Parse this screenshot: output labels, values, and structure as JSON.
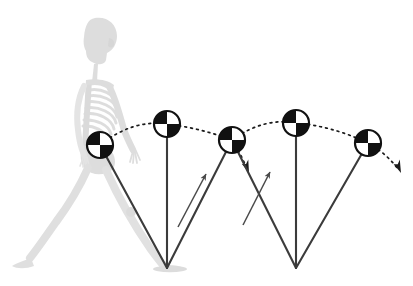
{
  "figure": {
    "title": "Inverted pendulum model of human walking gait",
    "background_color": "#ffffff",
    "width": 413,
    "height": 286
  },
  "colors": {
    "skeleton": "#c9c9c9",
    "skeleton_shadow": "#dcdcdc",
    "pendulum_leg": "#3b3b3b",
    "trajectory": "#1a1a1a",
    "com_marker_dark": "#111111",
    "com_marker_light": "#ffffff",
    "vector_arrow": "#4a4a4a",
    "ground_shadow": "#d2d2d2"
  },
  "skeleton": {
    "label": "walking human skeleton silhouette",
    "facing": "right",
    "opacity": 0.55
  },
  "com_markers": [
    {
      "id": "com-1",
      "label": "center of mass position 1",
      "phase": "valley",
      "x": 100,
      "y": 145,
      "r": 13
    },
    {
      "id": "com-2",
      "label": "center of mass position 2",
      "phase": "apex",
      "x": 167,
      "y": 124,
      "r": 13
    },
    {
      "id": "com-3",
      "label": "center of mass position 3",
      "phase": "valley",
      "x": 232,
      "y": 140,
      "r": 13
    },
    {
      "id": "com-4",
      "label": "center of mass position 4",
      "phase": "apex",
      "x": 296,
      "y": 123,
      "r": 13
    },
    {
      "id": "com-5",
      "label": "center of mass position 5",
      "phase": "valley",
      "x": 368,
      "y": 143,
      "r": 13
    }
  ],
  "ground_contacts": [
    {
      "id": "foot-1",
      "label": "stance foot contact point 1",
      "x": 167,
      "y": 268
    },
    {
      "id": "foot-2",
      "label": "stance foot contact point 2",
      "x": 296,
      "y": 268
    }
  ],
  "pendulum_legs": [
    {
      "id": "leg-1",
      "label": "stance limb from com-1 to foot-1",
      "x1": 100,
      "y1": 145,
      "x2": 167,
      "y2": 268
    },
    {
      "id": "leg-2",
      "label": "vertical stance limb at apex 2",
      "x1": 167,
      "y1": 124,
      "x2": 167,
      "y2": 268
    },
    {
      "id": "leg-3",
      "label": "trailing limb from com-3 to foot-1",
      "x1": 232,
      "y1": 140,
      "x2": 167,
      "y2": 268
    },
    {
      "id": "leg-4",
      "label": "leading limb from com-3 to foot-2",
      "x1": 232,
      "y1": 140,
      "x2": 296,
      "y2": 268
    },
    {
      "id": "leg-5",
      "label": "vertical stance limb at apex 4",
      "x1": 296,
      "y1": 123,
      "x2": 296,
      "y2": 268
    },
    {
      "id": "leg-6",
      "label": "trailing limb from com-5 to foot-2",
      "x1": 368,
      "y1": 143,
      "x2": 296,
      "y2": 268
    }
  ],
  "trajectory": {
    "label": "dotted arcing path of the center of mass",
    "style": "dotted",
    "dash_pattern": "2,4",
    "arcs": [
      {
        "id": "arc-1",
        "from": "com-1",
        "to": "com-2",
        "apex": "com-2"
      },
      {
        "id": "arc-2",
        "from": "com-2",
        "to": "com-3",
        "apex": "com-2"
      },
      {
        "id": "arc-3",
        "from": "com-3",
        "to": "com-4",
        "apex": "com-4"
      },
      {
        "id": "arc-4",
        "from": "com-4",
        "to": "com-5",
        "apex": "com-4"
      },
      {
        "id": "arc-5",
        "from": "com-5",
        "to": "end",
        "apex": "com-5"
      }
    ]
  },
  "trajectory_arrowheads": [
    {
      "id": "arrow-mid",
      "label": "descent direction arrowhead after com-3",
      "x": 248,
      "y": 172,
      "angle": 48
    },
    {
      "id": "arrow-end",
      "label": "descent direction arrowhead after com-5",
      "x": 400,
      "y": 172,
      "angle": 46
    }
  ],
  "force_vectors": [
    {
      "id": "vector-1",
      "label": "velocity vector along trailing limb 1",
      "x1": 178,
      "y1": 227,
      "x2": 206,
      "y2": 174
    },
    {
      "id": "vector-2",
      "label": "velocity vector along trailing limb 2",
      "x1": 243,
      "y1": 225,
      "x2": 270,
      "y2": 172
    }
  ]
}
